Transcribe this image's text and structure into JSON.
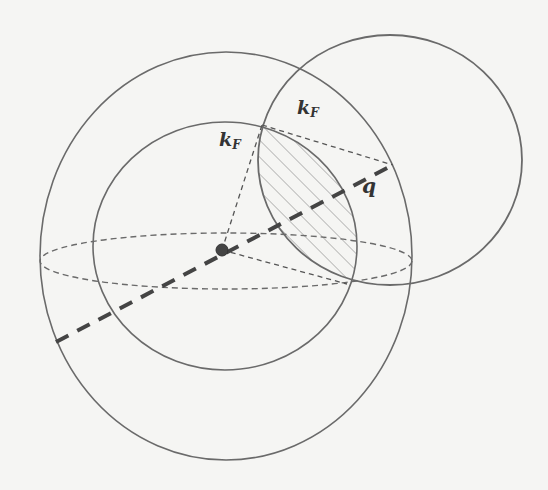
{
  "figure": {
    "type": "fermi-sphere-overlap-diagram",
    "colors": {
      "background": "#f5f5f3",
      "line": "#6a6a6a",
      "dash": "#5a5a5a",
      "thick_dash": "#444444",
      "dot": "#444444",
      "hatch": "#8a8a8a",
      "text": "#333333"
    },
    "labels": {
      "kf_left": {
        "main": "k",
        "sub": "F"
      },
      "kf_right": {
        "main": "k",
        "sub": "F"
      },
      "q": "q"
    },
    "shapes": {
      "outer_sphere": {
        "cx": 226,
        "cy": 256,
        "rx": 186,
        "ry": 204
      },
      "inner_sphere": {
        "cx": 225,
        "cy": 246,
        "rx": 132,
        "ry": 124
      },
      "shifted_sphere": {
        "cx": 390,
        "cy": 160,
        "rx": 132,
        "ry": 125
      },
      "equator_ellipse": {
        "cx": 226,
        "cy": 261,
        "rx": 186,
        "ry": 28
      },
      "center_dot": {
        "cx": 222,
        "cy": 250,
        "r": 6
      },
      "q_vector": {
        "x1": 56,
        "y1": 342,
        "x2": 393,
        "y2": 165
      },
      "radius_line_up": {
        "x1": 222,
        "y1": 250,
        "x2": 262,
        "y2": 125
      },
      "radius_line_down": {
        "x1": 222,
        "y1": 250,
        "x2": 347,
        "y2": 284
      },
      "chord_top": {
        "x1": 262,
        "y1": 125,
        "x2": 393,
        "y2": 165
      }
    }
  }
}
